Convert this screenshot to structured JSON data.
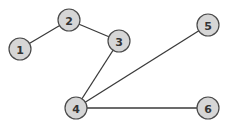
{
  "graph": {
    "style": {
      "node_fill": "#d6d6d6",
      "node_stroke": "#4a4a4a",
      "edge_color": "#3a3a3a",
      "background": "#ffffff"
    },
    "nodes": [
      {
        "id": "1",
        "label": "1",
        "x": 20,
        "y": 49
      },
      {
        "id": "2",
        "label": "2",
        "x": 69,
        "y": 20
      },
      {
        "id": "3",
        "label": "3",
        "x": 119,
        "y": 41
      },
      {
        "id": "4",
        "label": "4",
        "x": 76,
        "y": 108
      },
      {
        "id": "5",
        "label": "5",
        "x": 208,
        "y": 25
      },
      {
        "id": "6",
        "label": "6",
        "x": 208,
        "y": 108
      }
    ],
    "edges": [
      {
        "from": "1",
        "to": "2"
      },
      {
        "from": "2",
        "to": "3"
      },
      {
        "from": "3",
        "to": "4"
      },
      {
        "from": "4",
        "to": "5"
      },
      {
        "from": "4",
        "to": "6"
      }
    ]
  }
}
